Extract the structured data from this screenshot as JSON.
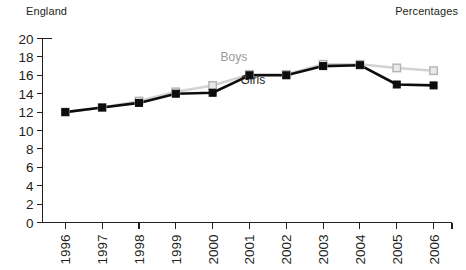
{
  "header": {
    "region_label": "England",
    "units_label": "Percentages"
  },
  "axis": {
    "y_ticks": [
      "0",
      "2",
      "4",
      "6",
      "8",
      "10",
      "12",
      "14",
      "16",
      "18",
      "20"
    ],
    "x_ticks": [
      "1996",
      "1997",
      "1998",
      "1999",
      "2000",
      "2001",
      "2002",
      "2003",
      "2004",
      "2005",
      "2006"
    ]
  },
  "legend": {
    "boys_label": "Boys",
    "girls_label": "Girls"
  },
  "colors": {
    "girls": "#0d0d0d",
    "boys": "#d3d3d3",
    "boys_marker_fill": "#e9e9e9",
    "boys_marker_stroke": "#b4b4b4",
    "axis": "#231f20",
    "background": "#ffffff"
  },
  "chart_data": {
    "type": "line",
    "title": "",
    "subtitle": "",
    "xlabel": "",
    "ylabel": "",
    "annotations": [
      "England",
      "Percentages"
    ],
    "grid": false,
    "legend_position": "inline",
    "ylim": [
      0,
      20
    ],
    "ytick_step": 2,
    "categories": [
      "1996",
      "1997",
      "1998",
      "1999",
      "2000",
      "2001",
      "2002",
      "2003",
      "2004",
      "2005",
      "2006"
    ],
    "series": [
      {
        "name": "Boys",
        "color": "#d3d3d3",
        "values": [
          12.0,
          12.5,
          13.2,
          14.2,
          14.9,
          16.1,
          16.1,
          17.2,
          17.2,
          16.8,
          16.5
        ]
      },
      {
        "name": "Girls",
        "color": "#0d0d0d",
        "values": [
          12.0,
          12.5,
          13.0,
          14.0,
          14.1,
          16.0,
          16.0,
          17.0,
          17.1,
          15.0,
          14.9
        ]
      }
    ]
  }
}
